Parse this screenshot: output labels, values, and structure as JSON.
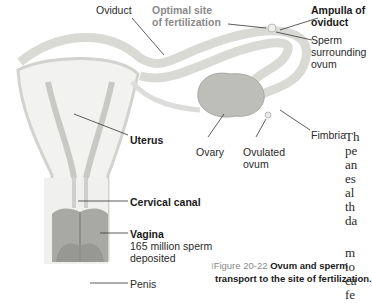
{
  "figure": {
    "labels": {
      "oviduct": "Oviduct",
      "optimal_site_1": "Optimal site",
      "optimal_site_2": "of fertilization",
      "ampulla_1": "Ampulla of",
      "ampulla_2": "oviduct",
      "sperm_1": "Sperm",
      "sperm_2": "surrounding",
      "sperm_3": "ovum",
      "uterus": "Uterus",
      "ovary": "Ovary",
      "ovulated_1": "Ovulated",
      "ovulated_2": "ovum",
      "fimbria": "Fimbria",
      "cervical_canal": "Cervical canal",
      "vagina": "Vagina",
      "vagina_note_1": "165 million sperm",
      "vagina_note_2": "deposited",
      "penis": "Penis"
    },
    "caption": {
      "number": "Figure 20-22",
      "line1": "Ovum and sperm",
      "line2": "transport to the site of fertilization."
    }
  },
  "body_text_fragments": [
    "Th",
    "pe",
    "an",
    "es",
    "al",
    "th",
    "da",
    "m",
    "io",
    "ca",
    "fe"
  ]
}
